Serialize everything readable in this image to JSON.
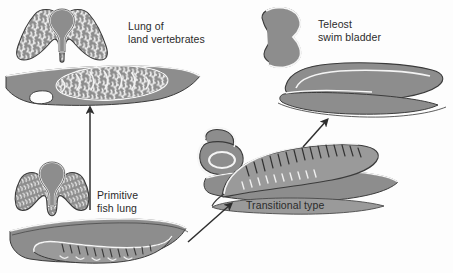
{
  "figure": {
    "background_color": "#fdfdfd",
    "tissue_fill": "#8d8d8d",
    "tissue_fill_light": "#9a9a9a",
    "outline_color": "#3a3a3a",
    "highlight_color": "#f2f2f2",
    "text_color": "#2b2b2b",
    "arrow_color": "#2e2e2e"
  },
  "labels": {
    "lung_of_land_vertebrates": "Lung of\nland vertebrates",
    "teleost_swim_bladder": "Teleost\nswim bladder",
    "primitive_fish_lung": "Primitive\nfish lung",
    "transitional_type": "Transitional type"
  },
  "stages": [
    {
      "id": "primitive-fish-lung",
      "label": "Primitive fish lung",
      "position": "bottom-left",
      "views": [
        "cross-section",
        "longitudinal-section"
      ],
      "description": "Paired ventral sac with shallow lateral lobes and comb-like septa; gas bladder lies ventral to the gut."
    },
    {
      "id": "lung-of-land-vertebrates",
      "label": "Lung of land vertebrates",
      "position": "top-left",
      "views": [
        "cross-section",
        "longitudinal-section"
      ],
      "description": "Ventral lung with highly subdivided alveolar tissue filling the lobes."
    },
    {
      "id": "transitional-type",
      "label": "Transitional type",
      "position": "bottom-middle",
      "views": [
        "cross-section",
        "longitudinal-section"
      ],
      "description": "Pneumatic duct migrates dorsally; sac rotates above the gut, septa still present."
    },
    {
      "id": "teleost-swim-bladder",
      "label": "Teleost swim bladder",
      "position": "top-right",
      "views": [
        "cross-section",
        "longitudinal-section"
      ],
      "description": "Single smooth-walled dorsal sac without septa, used for buoyancy."
    }
  ],
  "arrows": [
    {
      "id": "arrow-primitive-to-land",
      "from": "primitive-fish-lung",
      "to": "lung-of-land-vertebrates",
      "direction": "up"
    },
    {
      "id": "arrow-primitive-to-transitional",
      "from": "primitive-fish-lung",
      "to": "transitional-type",
      "direction": "up-right"
    },
    {
      "id": "arrow-transitional-to-teleost",
      "from": "transitional-type",
      "to": "teleost-swim-bladder",
      "direction": "up-right"
    }
  ]
}
